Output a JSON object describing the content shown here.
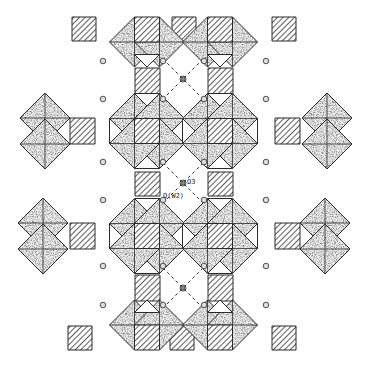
{
  "diagram": {
    "labels": {
      "o3": "O3",
      "ow2": "O(W2)"
    },
    "colors": {
      "stroke": "#2a2a2a",
      "stipple_fill": "#d9d9d9",
      "hatch": "#333333",
      "background": "#ffffff",
      "dash": "#333333"
    },
    "clusters": [
      {
        "name": "top-left-cluster",
        "type": "half-octamer"
      },
      {
        "name": "top-right-cluster",
        "type": "half-octamer"
      },
      {
        "name": "middle-left-cluster",
        "type": "octamer"
      },
      {
        "name": "middle-right-cluster",
        "type": "octamer"
      },
      {
        "name": "lower-left-cluster",
        "type": "octamer"
      },
      {
        "name": "lower-right-cluster",
        "type": "octamer"
      },
      {
        "name": "bottom-left-cluster",
        "type": "half-octamer"
      },
      {
        "name": "bottom-right-cluster",
        "type": "half-octamer"
      },
      {
        "name": "far-left-upper-pair",
        "type": "edge-sharing-pair"
      },
      {
        "name": "far-left-lower-pair",
        "type": "edge-sharing-pair"
      },
      {
        "name": "far-right-upper-pair",
        "type": "edge-sharing-pair"
      },
      {
        "name": "far-right-lower-pair",
        "type": "edge-sharing-pair"
      }
    ],
    "legend_items": [
      "stippled octahedra",
      "hatched tetrahedra",
      "water oxygen O(W2)",
      "oxygen O3"
    ]
  }
}
